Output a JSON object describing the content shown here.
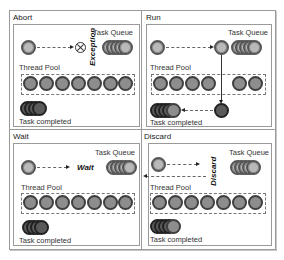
{
  "quadrants": {
    "abort": {
      "title": "Abort",
      "task_queue_label": "Task Queue",
      "thread_pool_label": "Thread Pool",
      "completed_label": "Task completed",
      "action_label": "Exception",
      "icon": "x-circle-icon"
    },
    "run": {
      "title": "Run",
      "task_queue_label": "Task Queue",
      "thread_pool_label": "Thread Pool",
      "completed_label": "Task completed"
    },
    "wait": {
      "title": "Wait",
      "task_queue_label": "Task Queue",
      "thread_pool_label": "Thread Pool",
      "completed_label": "Task completed",
      "action_label": "Wait"
    },
    "discard": {
      "title": "Discard",
      "task_queue_label": "Task Queue",
      "thread_pool_label": "Thread Pool",
      "completed_label": "Task completed",
      "action_label": "Discard"
    }
  },
  "colors": {
    "task_light": "#b9b9b9",
    "thread_mid": "#8d8d8d",
    "completed_dark": "#5a5a5a",
    "border": "#9a9a9a"
  }
}
